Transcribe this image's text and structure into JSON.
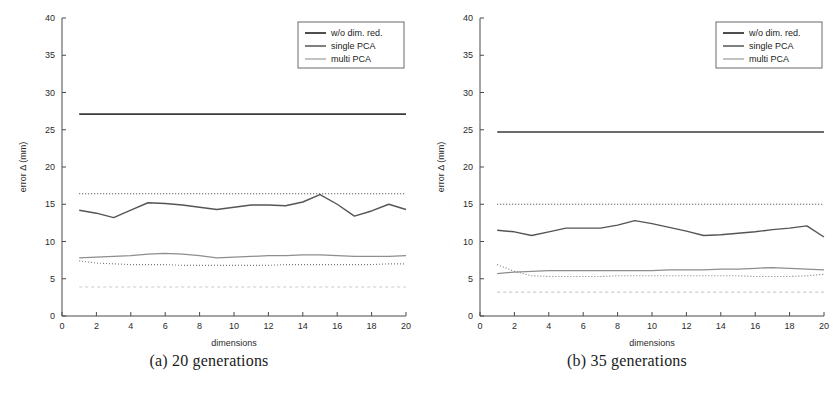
{
  "figure": {
    "caption_a": "(a) 20 generations",
    "caption_b": "(b) 35 generations"
  },
  "chart_data": [
    {
      "type": "line",
      "panel": "a",
      "title": "",
      "caption": "(a) 20 generations",
      "xlabel": "dimensions",
      "ylabel": "error Δ (mm)",
      "xlim": [
        0,
        20
      ],
      "ylim": [
        0,
        40
      ],
      "xticks": [
        0,
        2,
        4,
        6,
        8,
        10,
        12,
        14,
        16,
        18,
        20
      ],
      "yticks": [
        0,
        5,
        10,
        15,
        20,
        25,
        30,
        35,
        40
      ],
      "grid": false,
      "legend_position": "top-right",
      "x": [
        1,
        2,
        3,
        4,
        5,
        6,
        7,
        8,
        9,
        10,
        11,
        12,
        13,
        14,
        15,
        16,
        17,
        18,
        19,
        20
      ],
      "series": [
        {
          "name": "w/o dim. red.",
          "style": "solid",
          "color": "#3a3a3a",
          "width": 1.6,
          "values": [
            27.1,
            27.1,
            27.1,
            27.1,
            27.1,
            27.1,
            27.1,
            27.1,
            27.1,
            27.1,
            27.1,
            27.1,
            27.1,
            27.1,
            27.1,
            27.1,
            27.1,
            27.1,
            27.1,
            27.1
          ]
        },
        {
          "name": "single PCA",
          "style": "solid",
          "color": "#555555",
          "width": 1.4,
          "values": [
            14.2,
            13.8,
            13.2,
            14.2,
            15.2,
            15.1,
            14.9,
            14.6,
            14.3,
            14.6,
            14.9,
            14.9,
            14.8,
            15.3,
            16.3,
            15.0,
            13.4,
            14.1,
            15.0,
            14.3
          ]
        },
        {
          "name": "multi PCA",
          "style": "solid",
          "color": "#8e8e8e",
          "width": 1.3,
          "values": [
            7.8,
            7.9,
            8.0,
            8.1,
            8.3,
            8.4,
            8.3,
            8.1,
            7.8,
            7.9,
            8.0,
            8.1,
            8.1,
            8.2,
            8.2,
            8.1,
            8.0,
            8.0,
            8.0,
            8.1
          ]
        },
        {
          "name": "w/o dim. red. reference",
          "style": "dotted",
          "color": "#3c3c3c",
          "width": 1.1,
          "values": [
            16.4,
            16.4,
            16.4,
            16.4,
            16.4,
            16.4,
            16.4,
            16.4,
            16.4,
            16.4,
            16.4,
            16.4,
            16.4,
            16.4,
            16.4,
            16.4,
            16.4,
            16.4,
            16.4,
            16.4
          ]
        },
        {
          "name": "single PCA reference",
          "style": "dotted",
          "color": "#777777",
          "width": 1.1,
          "values": [
            7.4,
            7.1,
            7.0,
            6.9,
            6.9,
            6.9,
            6.8,
            6.8,
            6.8,
            6.8,
            6.8,
            6.8,
            6.9,
            6.9,
            6.9,
            6.9,
            6.9,
            6.9,
            7.0,
            7.0
          ]
        },
        {
          "name": "multi PCA reference",
          "style": "dashed",
          "color": "#cccccc",
          "width": 1.1,
          "values": [
            3.9,
            3.9,
            3.9,
            3.9,
            3.9,
            3.9,
            3.9,
            3.9,
            3.9,
            3.9,
            3.9,
            3.9,
            3.9,
            3.9,
            3.9,
            3.9,
            3.9,
            3.9,
            3.9,
            3.9
          ]
        }
      ],
      "legend": [
        "w/o dim. red.",
        "single PCA",
        "multi PCA"
      ]
    },
    {
      "type": "line",
      "panel": "b",
      "title": "",
      "caption": "(b) 35 generations",
      "xlabel": "dimensions",
      "ylabel": "error Δ (mm)",
      "xlim": [
        0,
        20
      ],
      "ylim": [
        0,
        40
      ],
      "xticks": [
        0,
        2,
        4,
        6,
        8,
        10,
        12,
        14,
        16,
        18,
        20
      ],
      "yticks": [
        0,
        5,
        10,
        15,
        20,
        25,
        30,
        35,
        40
      ],
      "grid": false,
      "legend_position": "top-right",
      "x": [
        1,
        2,
        3,
        4,
        5,
        6,
        7,
        8,
        9,
        10,
        11,
        12,
        13,
        14,
        15,
        16,
        17,
        18,
        19,
        20
      ],
      "series": [
        {
          "name": "w/o dim. red.",
          "style": "solid",
          "color": "#3a3a3a",
          "width": 1.6,
          "values": [
            24.7,
            24.7,
            24.7,
            24.7,
            24.7,
            24.7,
            24.7,
            24.7,
            24.7,
            24.7,
            24.7,
            24.7,
            24.7,
            24.7,
            24.7,
            24.7,
            24.7,
            24.7,
            24.7,
            24.7
          ]
        },
        {
          "name": "single PCA",
          "style": "solid",
          "color": "#555555",
          "width": 1.4,
          "values": [
            11.5,
            11.3,
            10.8,
            11.3,
            11.8,
            11.8,
            11.8,
            12.2,
            12.8,
            12.4,
            11.9,
            11.4,
            10.8,
            10.9,
            11.1,
            11.3,
            11.6,
            11.8,
            12.1,
            10.6
          ]
        },
        {
          "name": "multi PCA",
          "style": "solid",
          "color": "#8e8e8e",
          "width": 1.3,
          "values": [
            5.7,
            5.9,
            6.0,
            6.1,
            6.1,
            6.1,
            6.1,
            6.1,
            6.1,
            6.1,
            6.2,
            6.2,
            6.2,
            6.3,
            6.3,
            6.4,
            6.5,
            6.4,
            6.3,
            6.2
          ]
        },
        {
          "name": "w/o dim. red. reference",
          "style": "dotted",
          "color": "#3c3c3c",
          "width": 1.1,
          "values": [
            15.0,
            15.0,
            15.0,
            15.0,
            15.0,
            15.0,
            15.0,
            15.0,
            15.0,
            15.0,
            15.0,
            15.0,
            15.0,
            15.0,
            15.0,
            15.0,
            15.0,
            15.0,
            15.0,
            15.0
          ]
        },
        {
          "name": "single PCA reference",
          "style": "dotted",
          "color": "#777777",
          "width": 1.1,
          "values": [
            6.9,
            6.0,
            5.4,
            5.3,
            5.3,
            5.3,
            5.3,
            5.4,
            5.4,
            5.4,
            5.4,
            5.4,
            5.4,
            5.4,
            5.4,
            5.3,
            5.3,
            5.3,
            5.4,
            5.6
          ]
        },
        {
          "name": "multi PCA reference",
          "style": "dashed",
          "color": "#cccccc",
          "width": 1.1,
          "values": [
            3.2,
            3.2,
            3.2,
            3.2,
            3.2,
            3.2,
            3.2,
            3.2,
            3.2,
            3.2,
            3.2,
            3.2,
            3.2,
            3.2,
            3.2,
            3.2,
            3.2,
            3.2,
            3.2,
            3.2
          ]
        }
      ],
      "legend": [
        "w/o dim. red.",
        "single PCA",
        "multi PCA"
      ]
    }
  ]
}
